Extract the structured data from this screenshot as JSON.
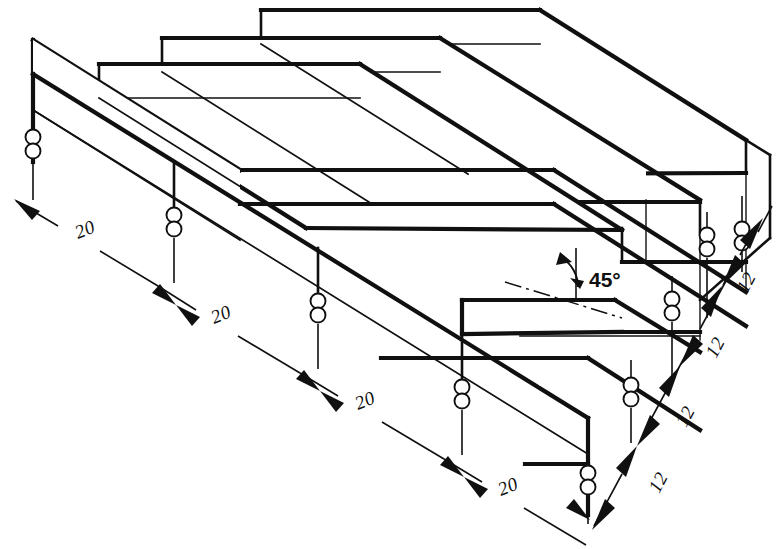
{
  "drawing": {
    "title": "Isometric serrated block with 45 degree staggered teeth",
    "background_color": "#ffffff",
    "line_color": "#101010"
  },
  "dimensions": {
    "length_chain": {
      "label_text": "20",
      "unit_implied": "mm",
      "count": 4,
      "values": [
        {
          "id": "len-1",
          "text": "20",
          "x": 78,
          "y": 239,
          "rotate": -22
        },
        {
          "id": "len-2",
          "text": "20",
          "x": 214,
          "y": 324,
          "rotate": -22
        },
        {
          "id": "len-3",
          "text": "20",
          "x": 358,
          "y": 410,
          "rotate": -22
        },
        {
          "id": "len-4",
          "text": "20",
          "x": 501,
          "y": 496,
          "rotate": -22
        }
      ]
    },
    "width_chain": {
      "label_text": "12",
      "unit_implied": "mm",
      "count": 4,
      "values": [
        {
          "id": "wid-1",
          "text": "12",
          "x": 659,
          "y": 494,
          "rotate": -62
        },
        {
          "id": "wid-2",
          "text": "12",
          "x": 686,
          "y": 428,
          "rotate": -62
        },
        {
          "id": "wid-3",
          "text": "12",
          "x": 716,
          "y": 359,
          "rotate": -62
        },
        {
          "id": "wid-4",
          "text": "12",
          "x": 747,
          "y": 294,
          "rotate": -62
        }
      ]
    },
    "angle": {
      "text": "45°",
      "value": 45,
      "x": 589,
      "y": 287
    }
  },
  "annotations": {
    "break_marker_name": "double-circle-break",
    "centerline_name": "tooth-centerline"
  }
}
